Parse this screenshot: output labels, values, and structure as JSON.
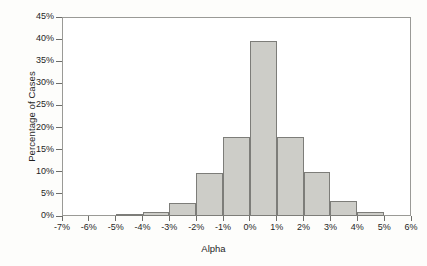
{
  "chart_data": {
    "type": "bar",
    "title": "",
    "xlabel": "Alpha",
    "ylabel": "Percentage of Cases",
    "bin_edges": [
      "-7%",
      "-6%",
      "-5%",
      "-4%",
      "-3%",
      "-2%",
      "-1%",
      "0%",
      "1%",
      "2%",
      "3%",
      "4%",
      "5%",
      "6%"
    ],
    "categories": [
      "-7% to -6%",
      "-6% to -5%",
      "-5% to -4%",
      "-4% to -3%",
      "-3% to -2%",
      "-2% to -1%",
      "-1% to 0%",
      "0% to 1%",
      "1% to 2%",
      "2% to 3%",
      "3% to 4%",
      "4% to 5%",
      "5% to 6%"
    ],
    "values": [
      0,
      0,
      0.4,
      1.0,
      3.0,
      9.7,
      17.9,
      39.6,
      17.9,
      10.0,
      3.5,
      1.0,
      0
    ],
    "xtick_labels": [
      "-7%",
      "-6%",
      "-5%",
      "-4%",
      "-3%",
      "-2%",
      "-1%",
      "0%",
      "1%",
      "2%",
      "3%",
      "4%",
      "5%",
      "6%"
    ],
    "ytick_labels": [
      "0%",
      "5%",
      "10%",
      "15%",
      "20%",
      "25%",
      "30%",
      "35%",
      "40%",
      "45%"
    ],
    "ytick_values": [
      0,
      5,
      10,
      15,
      20,
      25,
      30,
      35,
      40,
      45
    ],
    "ylim": [
      0,
      45
    ],
    "xlim": [
      -7,
      6
    ],
    "grid": false,
    "legend": null,
    "bar_fill_color": "#cdcdc8",
    "bar_edge_color": "#7d7d79",
    "axis_color": "#9a9a96",
    "background_color": "#fdfdfb"
  }
}
